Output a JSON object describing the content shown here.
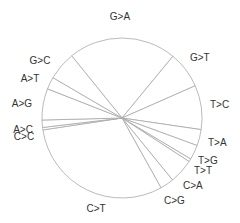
{
  "chart_data": {
    "type": "pie",
    "title": "",
    "start_angle_deg": -39,
    "direction": "clockwise",
    "center": [
      122,
      118
    ],
    "radius": 80,
    "colors": {
      "fill": "#ffffff",
      "stroke": "#a8a8a8",
      "label": "#333333"
    },
    "slices": [
      {
        "label": "G>A",
        "value": 22.0,
        "lx": 120,
        "ly": 20,
        "anchor": "middle"
      },
      {
        "label": "G>T",
        "value": 7.5,
        "lx": 190,
        "ly": 61,
        "anchor": "start"
      },
      {
        "label": "T>C",
        "value": 9.0,
        "lx": 210,
        "ly": 108,
        "anchor": "start"
      },
      {
        "label": "T>A",
        "value": 3.3,
        "lx": 208,
        "ly": 146,
        "anchor": "start"
      },
      {
        "label": "T>G",
        "value": 3.0,
        "lx": 198,
        "ly": 164,
        "anchor": "start"
      },
      {
        "label": "T>T",
        "value": 0.6,
        "lx": 194,
        "ly": 174,
        "anchor": "start"
      },
      {
        "label": "C>A",
        "value": 5.0,
        "lx": 183,
        "ly": 189,
        "anchor": "start"
      },
      {
        "label": "C>G",
        "value": 2.8,
        "lx": 164,
        "ly": 204,
        "anchor": "start"
      },
      {
        "label": "C>T",
        "value": 31.0,
        "lx": 96,
        "ly": 212,
        "anchor": "middle"
      },
      {
        "label": "C>C",
        "value": 0.5,
        "lx": 24,
        "ly": 140,
        "anchor": "middle"
      },
      {
        "label": "A>C",
        "value": 1.5,
        "lx": 23,
        "ly": 133,
        "anchor": "middle"
      },
      {
        "label": "A>G",
        "value": 6.4,
        "lx": 22,
        "ly": 107,
        "anchor": "middle"
      },
      {
        "label": "A>T",
        "value": 2.5,
        "lx": 30,
        "ly": 82,
        "anchor": "middle"
      },
      {
        "label": "G>C",
        "value": 5.8,
        "lx": 40,
        "ly": 64,
        "anchor": "middle"
      }
    ],
    "legend": "none"
  }
}
